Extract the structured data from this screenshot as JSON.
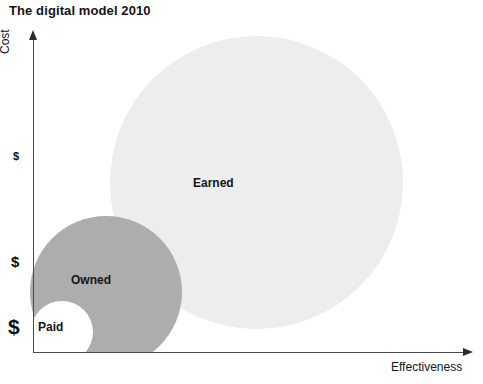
{
  "title": "The digital model 2010",
  "axes": {
    "y_label": "Cost",
    "x_label": "Effectiveness",
    "cost_ticks": [
      {
        "label": "$",
        "meaning": "low-cost"
      },
      {
        "label": "$",
        "meaning": "medium-cost"
      },
      {
        "label": "$",
        "meaning": "high-cost"
      }
    ]
  },
  "bubbles": [
    {
      "label": "Earned",
      "color": "#ededed",
      "size": "large"
    },
    {
      "label": "Owned",
      "color": "#adadad",
      "size": "medium"
    },
    {
      "label": "Paid",
      "color": "#ffffff",
      "size": "small"
    }
  ],
  "chart_data": {
    "type": "scatter",
    "title": "The digital model 2010",
    "xlabel": "Effectiveness",
    "ylabel": "Cost",
    "grid": false,
    "legend": "none",
    "xlim": [
      0,
      100
    ],
    "ylim": [
      0,
      100
    ],
    "ytick_labels": [
      "$",
      "$",
      "$"
    ],
    "ytick_values": [
      64,
      31,
      11
    ],
    "annotations": [
      "Earned",
      "Owned",
      "Paid"
    ],
    "series": [
      {
        "name": "Earned",
        "points": [
          {
            "x": 59,
            "y": 30,
            "r": 146,
            "label": "Earned"
          }
        ],
        "color": "#ededed"
      },
      {
        "name": "Owned",
        "points": [
          {
            "x": 17,
            "y": 8,
            "r": 76,
            "label": "Owned"
          }
        ],
        "color": "#adadad"
      },
      {
        "name": "Paid",
        "points": [
          {
            "x": 7,
            "y": 2,
            "r": 31,
            "label": "Paid"
          }
        ],
        "color": "#ffffff"
      }
    ]
  }
}
